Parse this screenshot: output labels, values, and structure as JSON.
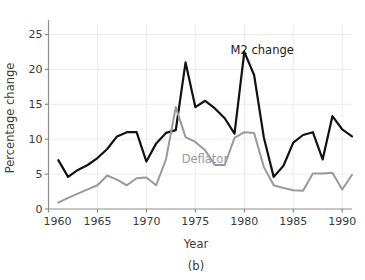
{
  "chart_data": {
    "type": "line",
    "title": "",
    "subtitle": "",
    "caption": "(b)",
    "xlabel": "Year",
    "ylabel": "Percentage change",
    "xlim": [
      1960,
      1991
    ],
    "ylim": [
      0,
      26.5
    ],
    "xticks": [
      1960,
      1965,
      1970,
      1975,
      1980,
      1985,
      1990
    ],
    "xtick_labels": [
      "1960",
      "1965",
      "1970",
      "1975",
      "1980",
      "1985",
      "1990"
    ],
    "yticks": [
      0,
      5,
      10,
      15,
      20,
      25
    ],
    "ytick_labels": [
      "0",
      "5",
      "10",
      "15",
      "20",
      "25"
    ],
    "grid": true,
    "grid_color": "#ececec",
    "legend_position": "inline-annotation",
    "x": [
      1961,
      1962,
      1963,
      1964,
      1965,
      1966,
      1967,
      1968,
      1969,
      1970,
      1971,
      1972,
      1973,
      1974,
      1975,
      1976,
      1977,
      1978,
      1979,
      1980,
      1981,
      1982,
      1983,
      1984,
      1985,
      1986,
      1987,
      1988,
      1989,
      1990,
      1991
    ],
    "series": [
      {
        "name": "M2 change",
        "color": "#111111",
        "width": 2.2,
        "label_x": 1978.6,
        "label_y": 22.2,
        "values": [
          7.0,
          4.6,
          5.6,
          6.3,
          7.3,
          8.6,
          10.4,
          11.0,
          11.0,
          6.8,
          9.4,
          10.9,
          11.3,
          21.0,
          14.6,
          15.5,
          14.4,
          13.0,
          10.8,
          22.5,
          19.2,
          10.2,
          4.6,
          6.2,
          9.5,
          10.6,
          11.0,
          7.1,
          13.3,
          11.4,
          10.4
        ]
      },
      {
        "name": "Deflator",
        "color": "#999999",
        "width": 2.0,
        "label_x": 1973.6,
        "label_y": 6.6,
        "values": [
          0.9,
          1.6,
          2.2,
          2.8,
          3.4,
          4.8,
          4.2,
          3.4,
          4.4,
          4.5,
          3.4,
          7.1,
          14.6,
          10.3,
          9.6,
          8.4,
          6.3,
          6.3,
          10.2,
          11.0,
          10.9,
          6.0,
          3.4,
          3.0,
          2.7,
          2.6,
          5.1,
          5.1,
          5.2,
          2.8,
          4.9
        ]
      }
    ],
    "annotations": [
      {
        "text": "M2 change",
        "x": 1978.6,
        "y": 22.2,
        "color": "#111111"
      },
      {
        "text": "Deflator",
        "x": 1973.6,
        "y": 6.6,
        "color": "#999999"
      }
    ]
  },
  "figure": {
    "caption_label": "(b)",
    "x_axis_title": "Year",
    "y_axis_title": "Percentage change"
  }
}
